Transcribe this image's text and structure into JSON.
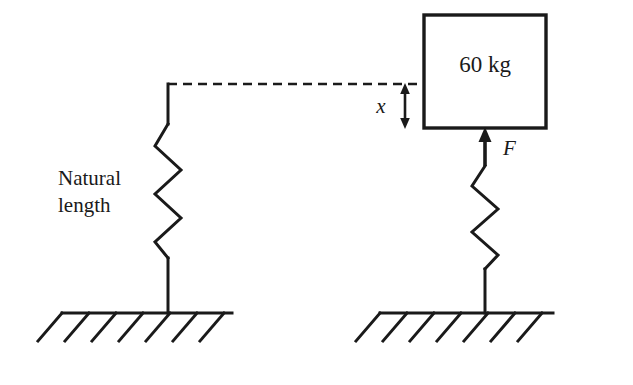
{
  "diagram": {
    "stroke_color": "#1a1a1a",
    "background_color": "#ffffff",
    "labels": {
      "mass": "60 kg",
      "natural_line1": "Natural",
      "natural_line2": "length",
      "displacement": "x",
      "force": "F"
    },
    "left_assembly": {
      "caption_line1": "Natural",
      "caption_line2": "length",
      "spring_state": "natural",
      "ground_hatch_count": 7
    },
    "right_assembly": {
      "mass_label": "60 kg",
      "force_label": "F",
      "displacement_label": "x",
      "spring_state": "compressed",
      "ground_hatch_count": 7
    }
  }
}
